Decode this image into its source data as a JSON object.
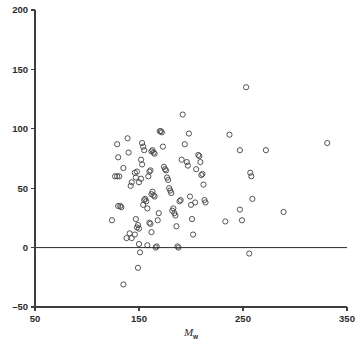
{
  "chart_data": {
    "type": "scatter",
    "title": "",
    "subtitle": "",
    "xlabel": "Mw",
    "xlabel_base": "M",
    "xlabel_sub": "w",
    "ylabel": "",
    "xlim": [
      50,
      350
    ],
    "ylim": [
      -50,
      200
    ],
    "xticks": [
      50,
      150,
      250,
      350
    ],
    "xtick_labels": [
      "50",
      "150",
      "250",
      "350"
    ],
    "yticks": [
      -50,
      0,
      50,
      100,
      150,
      200
    ],
    "ytick_labels": [
      "-50",
      "0",
      "50",
      "100",
      "150",
      "200"
    ],
    "grid": false,
    "legend": null,
    "legend_position": "none",
    "annotations": [
      {
        "kind": "reference-line",
        "axis": "y",
        "value": 0,
        "label": "zero line"
      }
    ],
    "marker": {
      "shape": "open-circle",
      "radius": 2.6,
      "color": "#4a4a4a",
      "fill": "none"
    },
    "series": [
      {
        "name": "observations",
        "color": "#4a4a4a",
        "points": [
          [
            129,
            87
          ],
          [
            130,
            76
          ],
          [
            124,
            23
          ],
          [
            127,
            60
          ],
          [
            129,
            60
          ],
          [
            131,
            60
          ],
          [
            130,
            35
          ],
          [
            132,
            35
          ],
          [
            133,
            34
          ],
          [
            135,
            67
          ],
          [
            139,
            92
          ],
          [
            140,
            80
          ],
          [
            142,
            52
          ],
          [
            143,
            55
          ],
          [
            141,
            12
          ],
          [
            138,
            8
          ],
          [
            143,
            8
          ],
          [
            146,
            11
          ],
          [
            147,
            24
          ],
          [
            148,
            17
          ],
          [
            149,
            19
          ],
          [
            150,
            16
          ],
          [
            150,
            3
          ],
          [
            151,
            -4
          ],
          [
            149,
            -17
          ],
          [
            135,
            -31
          ],
          [
            146,
            63
          ],
          [
            148,
            64
          ],
          [
            147,
            59
          ],
          [
            150,
            55
          ],
          [
            152,
            58
          ],
          [
            153,
            88
          ],
          [
            154,
            85
          ],
          [
            155,
            82
          ],
          [
            152,
            74
          ],
          [
            153,
            70
          ],
          [
            154,
            36
          ],
          [
            155,
            40
          ],
          [
            156,
            41
          ],
          [
            157,
            39
          ],
          [
            158,
            33
          ],
          [
            159,
            60
          ],
          [
            160,
            64
          ],
          [
            161,
            65
          ],
          [
            162,
            81
          ],
          [
            163,
            82
          ],
          [
            164,
            80
          ],
          [
            165,
            79
          ],
          [
            162,
            45
          ],
          [
            163,
            47
          ],
          [
            164,
            44
          ],
          [
            165,
            43
          ],
          [
            158,
            2
          ],
          [
            160,
            21
          ],
          [
            161,
            20
          ],
          [
            162,
            13
          ],
          [
            166,
            0
          ],
          [
            167,
            1
          ],
          [
            168,
            23
          ],
          [
            169,
            29
          ],
          [
            170,
            98
          ],
          [
            171,
            98
          ],
          [
            172,
            97
          ],
          [
            173,
            85
          ],
          [
            174,
            68
          ],
          [
            175,
            66
          ],
          [
            176,
            65
          ],
          [
            177,
            59
          ],
          [
            178,
            57
          ],
          [
            179,
            50
          ],
          [
            180,
            48
          ],
          [
            181,
            46
          ],
          [
            182,
            31
          ],
          [
            183,
            33
          ],
          [
            184,
            29
          ],
          [
            185,
            27
          ],
          [
            186,
            18
          ],
          [
            187,
            1
          ],
          [
            188,
            0
          ],
          [
            189,
            39
          ],
          [
            190,
            40
          ],
          [
            191,
            74
          ],
          [
            192,
            112
          ],
          [
            194,
            87
          ],
          [
            196,
            72
          ],
          [
            197,
            69
          ],
          [
            198,
            96
          ],
          [
            199,
            43
          ],
          [
            200,
            36
          ],
          [
            201,
            24
          ],
          [
            202,
            11
          ],
          [
            204,
            38
          ],
          [
            205,
            66
          ],
          [
            207,
            78
          ],
          [
            208,
            77
          ],
          [
            209,
            72
          ],
          [
            210,
            61
          ],
          [
            211,
            62
          ],
          [
            212,
            53
          ],
          [
            213,
            40
          ],
          [
            214,
            38
          ],
          [
            237,
            95
          ],
          [
            233,
            22
          ],
          [
            247,
            82
          ],
          [
            247,
            32
          ],
          [
            249,
            23
          ],
          [
            253,
            135
          ],
          [
            257,
            63
          ],
          [
            258,
            60
          ],
          [
            259,
            41
          ],
          [
            256,
            -5
          ],
          [
            272,
            82
          ],
          [
            289,
            30
          ],
          [
            331,
            88
          ]
        ]
      }
    ]
  },
  "axes": {
    "x_axis_name": "x-axis",
    "y_axis_name": "y-axis"
  }
}
